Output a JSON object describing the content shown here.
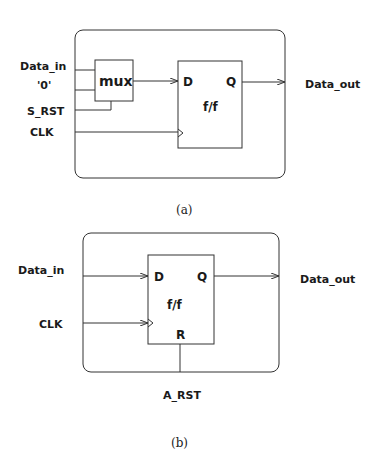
{
  "figure_a": {
    "caption": "(a)",
    "inputs": [
      "Data_in",
      "'0'",
      "S_RST",
      "CLK"
    ],
    "mux_label": "mux",
    "ff_label": "f/f",
    "ff_d": "D",
    "ff_q": "Q",
    "output": "Data_out"
  },
  "figure_b": {
    "caption": "(b)",
    "inputs": [
      "Data_in",
      "CLK"
    ],
    "ff_label": "f/f",
    "ff_d": "D",
    "ff_q": "Q",
    "ff_r": "R",
    "reset": "A_RST",
    "output": "Data_out"
  },
  "colors": {
    "line": "#333333",
    "text": "#1a1a1a",
    "background": "#ffffff"
  }
}
